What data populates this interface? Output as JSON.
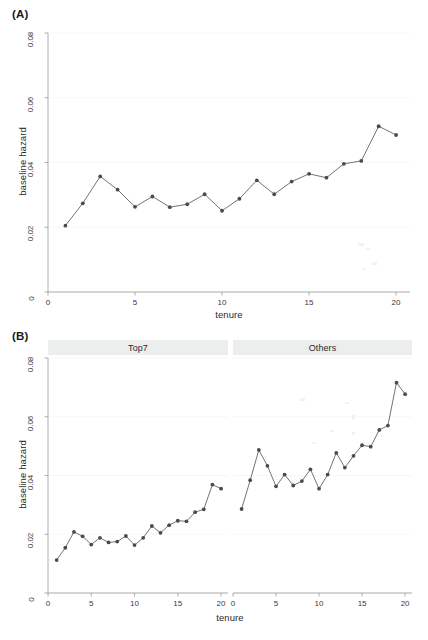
{
  "figure": {
    "background": "#ffffff",
    "line_color": "#5a5a5f",
    "point_color": "#4a4a50",
    "axis_color": "#9a9a9a",
    "grid_color": "#f4f4f4",
    "strip_fill": "#eceded"
  },
  "panel_a": {
    "label": "(A)",
    "ylabel": "baseline hazard",
    "xlabel": "tenure",
    "yticks": [
      "0",
      "0.02",
      "0.04",
      "0.06",
      "0.08"
    ],
    "ytick_values": [
      0,
      0.02,
      0.04,
      0.06,
      0.08
    ],
    "xticks": [
      "0",
      "5",
      "10",
      "15",
      "20"
    ],
    "xtick_values": [
      0,
      5,
      10,
      15,
      20
    ]
  },
  "panel_b": {
    "label": "(B)",
    "ylabel": "baseline hazard",
    "xlabel": "tenure",
    "yticks": [
      "0",
      "0.02",
      "0.04",
      "0.06",
      "0.08"
    ],
    "ytick_values": [
      0,
      0.02,
      0.04,
      0.06,
      0.08
    ],
    "xticks": [
      "0",
      "5",
      "10",
      "15",
      "20"
    ],
    "xtick_values": [
      0,
      5,
      10,
      15,
      20
    ],
    "facets": [
      {
        "label": "Top7"
      },
      {
        "label": "Others"
      }
    ]
  },
  "chart_data": [
    {
      "type": "line",
      "panel": "(A)",
      "title": "",
      "xlabel": "tenure",
      "ylabel": "baseline hazard",
      "xlim": [
        0,
        20.8
      ],
      "ylim": [
        0,
        0.08
      ],
      "grid": true,
      "legend": "none",
      "marker": "filled-circle",
      "x": [
        1,
        2,
        3,
        4,
        5,
        6,
        7,
        8,
        9,
        10,
        11,
        12,
        13,
        14,
        15,
        16,
        17,
        18,
        19,
        20
      ],
      "values": [
        0.0205,
        0.0274,
        0.0357,
        0.0316,
        0.0263,
        0.0295,
        0.0262,
        0.0271,
        0.0302,
        0.0251,
        0.0288,
        0.0345,
        0.0302,
        0.0341,
        0.0365,
        0.0353,
        0.0396,
        0.0405,
        0.0512,
        0.0485
      ]
    },
    {
      "type": "line",
      "panel": "(B)",
      "facet": "Top7",
      "title": "Top7",
      "xlabel": "tenure",
      "ylabel": "baseline hazard",
      "xlim": [
        0,
        20.8
      ],
      "ylim": [
        0,
        0.08
      ],
      "grid": true,
      "legend": "none",
      "marker": "filled-circle",
      "x": [
        1,
        2,
        3,
        4,
        5,
        6,
        7,
        8,
        9,
        10,
        11,
        12,
        13,
        14,
        15,
        16,
        17,
        18,
        19,
        20
      ],
      "values": [
        0.0112,
        0.0154,
        0.0208,
        0.0193,
        0.0165,
        0.0188,
        0.0172,
        0.0175,
        0.0194,
        0.0163,
        0.0188,
        0.0228,
        0.0205,
        0.0231,
        0.0246,
        0.0244,
        0.0275,
        0.0285,
        0.0369,
        0.0355
      ]
    },
    {
      "type": "line",
      "panel": "(B)",
      "facet": "Others",
      "title": "Others",
      "xlabel": "tenure",
      "ylabel": "baseline hazard",
      "xlim": [
        0,
        20.8
      ],
      "ylim": [
        0,
        0.08
      ],
      "grid": true,
      "legend": "none",
      "marker": "filled-circle",
      "x": [
        1,
        2,
        3,
        4,
        5,
        6,
        7,
        8,
        9,
        10,
        11,
        12,
        13,
        14,
        15,
        16,
        17,
        18,
        19,
        20
      ],
      "values": [
        0.0286,
        0.0384,
        0.0487,
        0.0433,
        0.0363,
        0.0403,
        0.0366,
        0.0381,
        0.0421,
        0.0355,
        0.0403,
        0.0477,
        0.0427,
        0.0467,
        0.0503,
        0.0498,
        0.0555,
        0.057,
        0.0716,
        0.0677
      ]
    }
  ]
}
